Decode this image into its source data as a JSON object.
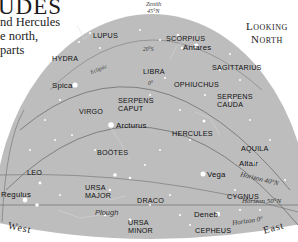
{
  "header": {
    "title": "UDES",
    "intro_lines": [
      "nd Hercules",
      "e north,",
      "parts"
    ],
    "looking": [
      "Looking",
      "North"
    ]
  },
  "annotations": {
    "zenith": "Zenith",
    "zenith_lat": "45°N",
    "ecliptic": "Ecliptic",
    "deg20": "20°S",
    "deg0": "0°",
    "horizon_40": "Horizon 40°N",
    "horizon_50": "Horizon 50°N",
    "horizon_0": "Horizon 0°",
    "west": "West",
    "east": "East"
  },
  "constellations": {
    "lupus": "LUPUS",
    "scorpius": "SCORPIUS",
    "hydra": "HYDRA",
    "libra": "LIBRA",
    "sagittarius": "SAGITTARIUS",
    "ophiuchus": "OPHIUCHUS",
    "virgo": "VIRGO",
    "serpens_caput": [
      "SERPENS",
      "CAPUT"
    ],
    "serpens_cauda": [
      "SERPENS",
      "CAUDA"
    ],
    "hercules": "HERCULES",
    "bootes": "BOÖTES",
    "aquila": "AQUILA",
    "leo": "LEO",
    "ursa_major": [
      "URSA",
      "MAJOR"
    ],
    "draco": "DRACO",
    "cygnus": "CYGNUS",
    "ursa_minor": [
      "URSA",
      "MINOR"
    ],
    "cepheus": "CEPHEUS",
    "plough": "Plough"
  },
  "stars": {
    "antares": "Antares",
    "spica": "Spica",
    "arcturus": "Arcturus",
    "altair": "Altair",
    "vega": "Vega",
    "regulus": "Regulus",
    "deneb": "Deneb"
  },
  "colors": {
    "sky": "#bdbdbd",
    "line": "#6e6e6e",
    "text": "#111111",
    "star": "#ffffff"
  }
}
